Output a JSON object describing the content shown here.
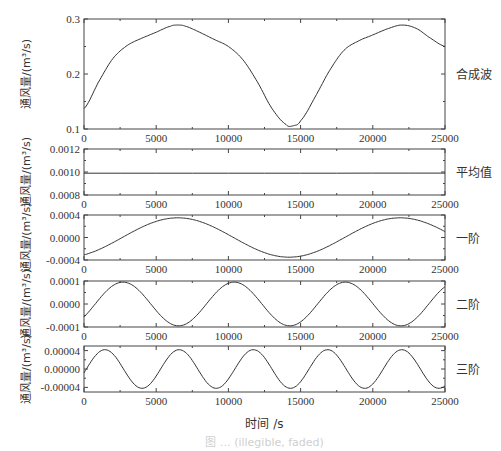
{
  "figure": {
    "xlabel": "时间 /s",
    "caption": "图 … (illegible, faded)"
  },
  "chart_data": [
    {
      "type": "line",
      "panel_label": "合成波",
      "ylabel": "通风量/(m³/s)",
      "xlabel": "",
      "xlim": [
        0,
        25000
      ],
      "ylim": [
        0.1,
        0.3
      ],
      "x_ticks": [
        "0",
        "5000",
        "10000",
        "15000",
        "20000",
        "25000"
      ],
      "y_ticks": [
        "0.1",
        "0.2",
        "0.3"
      ],
      "x": [
        0,
        1000,
        2000,
        3000,
        4000,
        5000,
        6000,
        6500,
        7000,
        8000,
        9000,
        10000,
        11000,
        12000,
        13000,
        14000,
        14500,
        15000,
        16000,
        17000,
        18000,
        19000,
        20000,
        21000,
        22000,
        23000,
        24000,
        25000
      ],
      "values": [
        0.137,
        0.185,
        0.228,
        0.252,
        0.265,
        0.276,
        0.287,
        0.289,
        0.287,
        0.276,
        0.263,
        0.25,
        0.226,
        0.186,
        0.138,
        0.108,
        0.106,
        0.115,
        0.158,
        0.206,
        0.243,
        0.26,
        0.271,
        0.282,
        0.289,
        0.283,
        0.265,
        0.25
      ]
    },
    {
      "type": "line",
      "panel_label": "平均值",
      "ylabel": "通风量/(m³/s)",
      "xlim": [
        0,
        25000
      ],
      "ylim": [
        0.0008,
        0.0012
      ],
      "x_ticks": [
        "0",
        "5000",
        "10000",
        "15000",
        "20000",
        "25000"
      ],
      "y_ticks": [
        "0.0008",
        "0.0010",
        "0.0012"
      ],
      "x": [
        0,
        25000
      ],
      "values": [
        0.00099,
        0.00099
      ]
    },
    {
      "type": "line",
      "panel_label": "一阶",
      "ylabel": "通风量/(m³/s)",
      "xlim": [
        0,
        25000
      ],
      "ylim": [
        -0.0004,
        0.0004
      ],
      "x_ticks": [
        "0",
        "5000",
        "10000",
        "15000",
        "20000",
        "25000"
      ],
      "y_ticks": [
        "-0.0004",
        "0.0000",
        "0.0004"
      ],
      "amplitude": 0.00035,
      "period": 15400,
      "peak_x": 6500
    },
    {
      "type": "line",
      "panel_label": "二阶",
      "ylabel": "通风量/(m³/s)",
      "xlim": [
        0,
        25000
      ],
      "ylim": [
        -0.0001,
        0.0001
      ],
      "x_ticks": [
        "0",
        "5000",
        "10000",
        "15000",
        "20000",
        "25000"
      ],
      "y_ticks": [
        "-0.0001",
        "0.0000",
        "0.0001"
      ],
      "amplitude": 9.5e-05,
      "period": 7700,
      "peak_x": 2700
    },
    {
      "type": "line",
      "panel_label": "三阶",
      "ylabel": "通风量/(m³/s)",
      "xlim": [
        0,
        25000
      ],
      "ylim": [
        -5e-05,
        5e-05
      ],
      "x_ticks": [
        "0",
        "5000",
        "10000",
        "15000",
        "20000",
        "25000"
      ],
      "y_ticks": [
        "-0.00004",
        "0.00000",
        "0.00004"
      ],
      "amplitude": 4.2e-05,
      "period": 5140,
      "peak_x": 1450
    }
  ]
}
